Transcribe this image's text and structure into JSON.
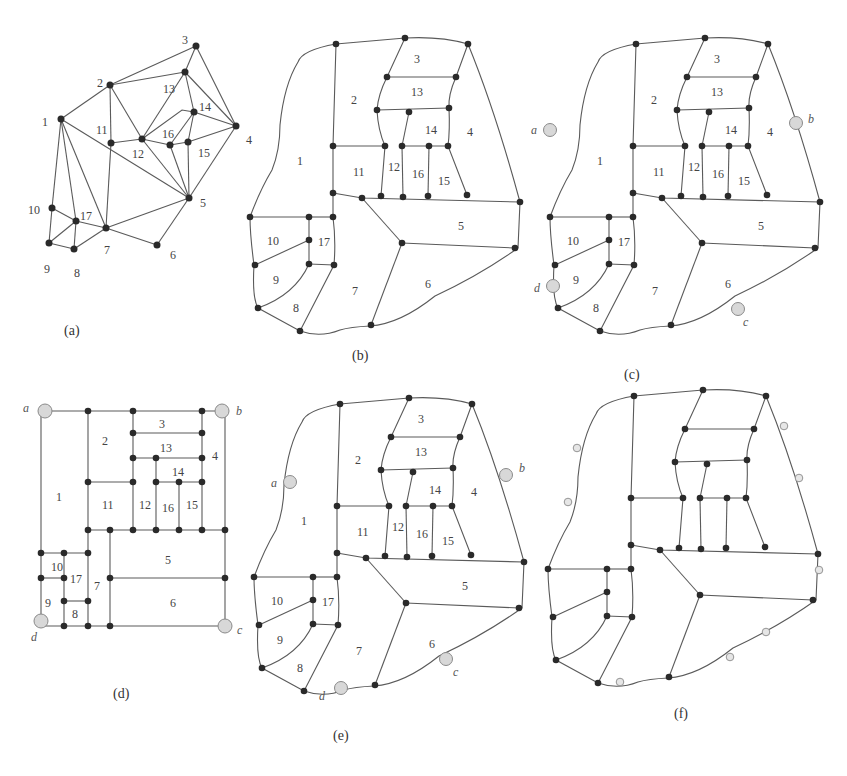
{
  "figure": {
    "panels": [
      {
        "id": "a",
        "caption": "(a)",
        "description": "Planar adjacency graph with 17 numbered vertices"
      },
      {
        "id": "b",
        "caption": "(b)",
        "description": "Rectangular-like dual layout with 17 numbered regions"
      },
      {
        "id": "c",
        "caption": "(c)",
        "description": "Layout (b) with four corner points a, b, c, d"
      },
      {
        "id": "d",
        "caption": "(d)",
        "description": "Rectangular floorplan with corner points a, b, c, d"
      },
      {
        "id": "e",
        "caption": "(e)",
        "description": "Layout with relocated corner points a, b, c, d"
      },
      {
        "id": "f",
        "caption": "(f)",
        "description": "Layout with additional boundary points, unlabeled"
      }
    ],
    "vertex_labels": [
      "1",
      "2",
      "3",
      "4",
      "5",
      "6",
      "7",
      "8",
      "9",
      "10",
      "11",
      "12",
      "13",
      "14",
      "15",
      "16",
      "17"
    ],
    "corner_labels": {
      "a": "a",
      "b": "b",
      "c": "c",
      "d": "d"
    },
    "graph_a": {
      "edges": [
        [
          "1",
          "2"
        ],
        [
          "1",
          "10"
        ],
        [
          "1",
          "17"
        ],
        [
          "1",
          "7"
        ],
        [
          "1",
          "5"
        ],
        [
          "2",
          "3"
        ],
        [
          "2",
          "13"
        ],
        [
          "2",
          "11"
        ],
        [
          "2",
          "12"
        ],
        [
          "3",
          "13"
        ],
        [
          "3",
          "4"
        ],
        [
          "13",
          "12"
        ],
        [
          "13",
          "14"
        ],
        [
          "13",
          "4"
        ],
        [
          "14",
          "4"
        ],
        [
          "14",
          "16"
        ],
        [
          "14",
          "15"
        ],
        [
          "14",
          "12"
        ],
        [
          "4",
          "15"
        ],
        [
          "4",
          "5"
        ],
        [
          "11",
          "12"
        ],
        [
          "11",
          "7"
        ],
        [
          "12",
          "16"
        ],
        [
          "12",
          "5"
        ],
        [
          "16",
          "15"
        ],
        [
          "16",
          "5"
        ],
        [
          "15",
          "5"
        ],
        [
          "5",
          "7"
        ],
        [
          "5",
          "6"
        ],
        [
          "7",
          "6"
        ],
        [
          "10",
          "17"
        ],
        [
          "10",
          "9"
        ],
        [
          "9",
          "17"
        ],
        [
          "9",
          "8"
        ],
        [
          "8",
          "17"
        ],
        [
          "8",
          "7"
        ],
        [
          "17",
          "7"
        ]
      ]
    }
  }
}
